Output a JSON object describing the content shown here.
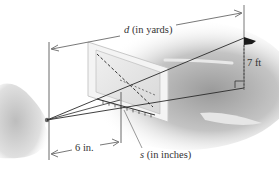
{
  "figure": {
    "type": "rangefinder-diagram"
  },
  "labels": {
    "distance": "d (in yards)",
    "distance_var": "d",
    "distance_unit": " (in yards)",
    "flag_height": "7 ft",
    "card_distance": "6 in.",
    "scale_reading": "s (in inches)",
    "scale_var": "s",
    "scale_unit": " (in inches)"
  },
  "colors": {
    "line": "#2a2a2a",
    "dimension_line": "#555555",
    "text": "#333333",
    "card_face": "#e4e4e4",
    "card_frame": "#f2f2f2",
    "background_shade": "#b8b8b8"
  }
}
